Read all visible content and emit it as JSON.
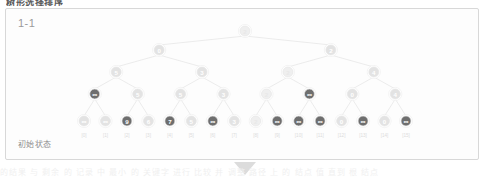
{
  "page": {
    "top_heading": "树形选择排序",
    "card_label": "1-1",
    "caption": "初始状态",
    "bottom_band_text": "的结果 与 剩余 的 记录 中 最小 的 关键字 进行 比较 并 调整 路径 上 的 结点 值 直到 根 结点",
    "colors": {
      "card_border": "#d8d8d8",
      "card_bg": "#fdfdfd",
      "edge": "#e4e4e4",
      "node_light_fill": "#e3e3e3",
      "node_light_text": "#ffffff",
      "node_dark_fill": "#6e6e6e",
      "node_dark_text": "#ffffff",
      "node_faint_fill": "#efefef",
      "index_text": "#dcdcdc",
      "arrow": "#dcdcdc"
    }
  },
  "tree": {
    "title": "树形选择排序 - 初始状态",
    "levels": [
      {
        "level": 0,
        "name": "root",
        "nodes": [
          {
            "value": "2",
            "shade": "faint"
          }
        ]
      },
      {
        "level": 1,
        "name": "level-1",
        "nodes": [
          {
            "value": "0",
            "shade": "light"
          },
          {
            "value": "2",
            "shade": "light"
          }
        ]
      },
      {
        "level": 2,
        "name": "level-2",
        "nodes": [
          {
            "value": "5",
            "shade": "light"
          },
          {
            "value": "3",
            "shade": "light"
          },
          {
            "value": "2",
            "shade": "faint"
          },
          {
            "value": "4",
            "shade": "light"
          }
        ]
      },
      {
        "level": 3,
        "name": "level-3",
        "nodes": [
          {
            "value": "∞",
            "shade": "dark"
          },
          {
            "value": "5",
            "shade": "light"
          },
          {
            "value": "5",
            "shade": "light"
          },
          {
            "value": "3",
            "shade": "light"
          },
          {
            "value": "2",
            "shade": "faint"
          },
          {
            "value": "∞",
            "shade": "dark"
          },
          {
            "value": "0",
            "shade": "light"
          },
          {
            "value": "4",
            "shade": "light"
          }
        ]
      },
      {
        "level": 4,
        "name": "leaf-level",
        "nodes": [
          {
            "value": "∞",
            "shade": "light",
            "index": "[0]"
          },
          {
            "value": "∞",
            "shade": "light",
            "index": "[1]"
          },
          {
            "value": "9",
            "shade": "dark",
            "index": "[2]"
          },
          {
            "value": "6",
            "shade": "light",
            "index": "[3]"
          },
          {
            "value": "7",
            "shade": "dark",
            "index": "[4]"
          },
          {
            "value": "5",
            "shade": "light",
            "index": "[5]"
          },
          {
            "value": "∞",
            "shade": "dark",
            "index": "[6]"
          },
          {
            "value": "3",
            "shade": "light",
            "index": "[7]"
          },
          {
            "value": "2",
            "shade": "faint",
            "index": "[8]"
          },
          {
            "value": "∞",
            "shade": "dark",
            "index": "[9]"
          },
          {
            "value": "∞",
            "shade": "dark",
            "index": "[10]"
          },
          {
            "value": "∞",
            "shade": "dark",
            "index": "[11]"
          },
          {
            "value": "0",
            "shade": "light",
            "index": "[12]"
          },
          {
            "value": "∞",
            "shade": "dark",
            "index": "[13]"
          },
          {
            "value": "0",
            "shade": "light",
            "index": "[14]"
          },
          {
            "value": "∞",
            "shade": "dark",
            "index": "[15]"
          }
        ]
      }
    ]
  }
}
